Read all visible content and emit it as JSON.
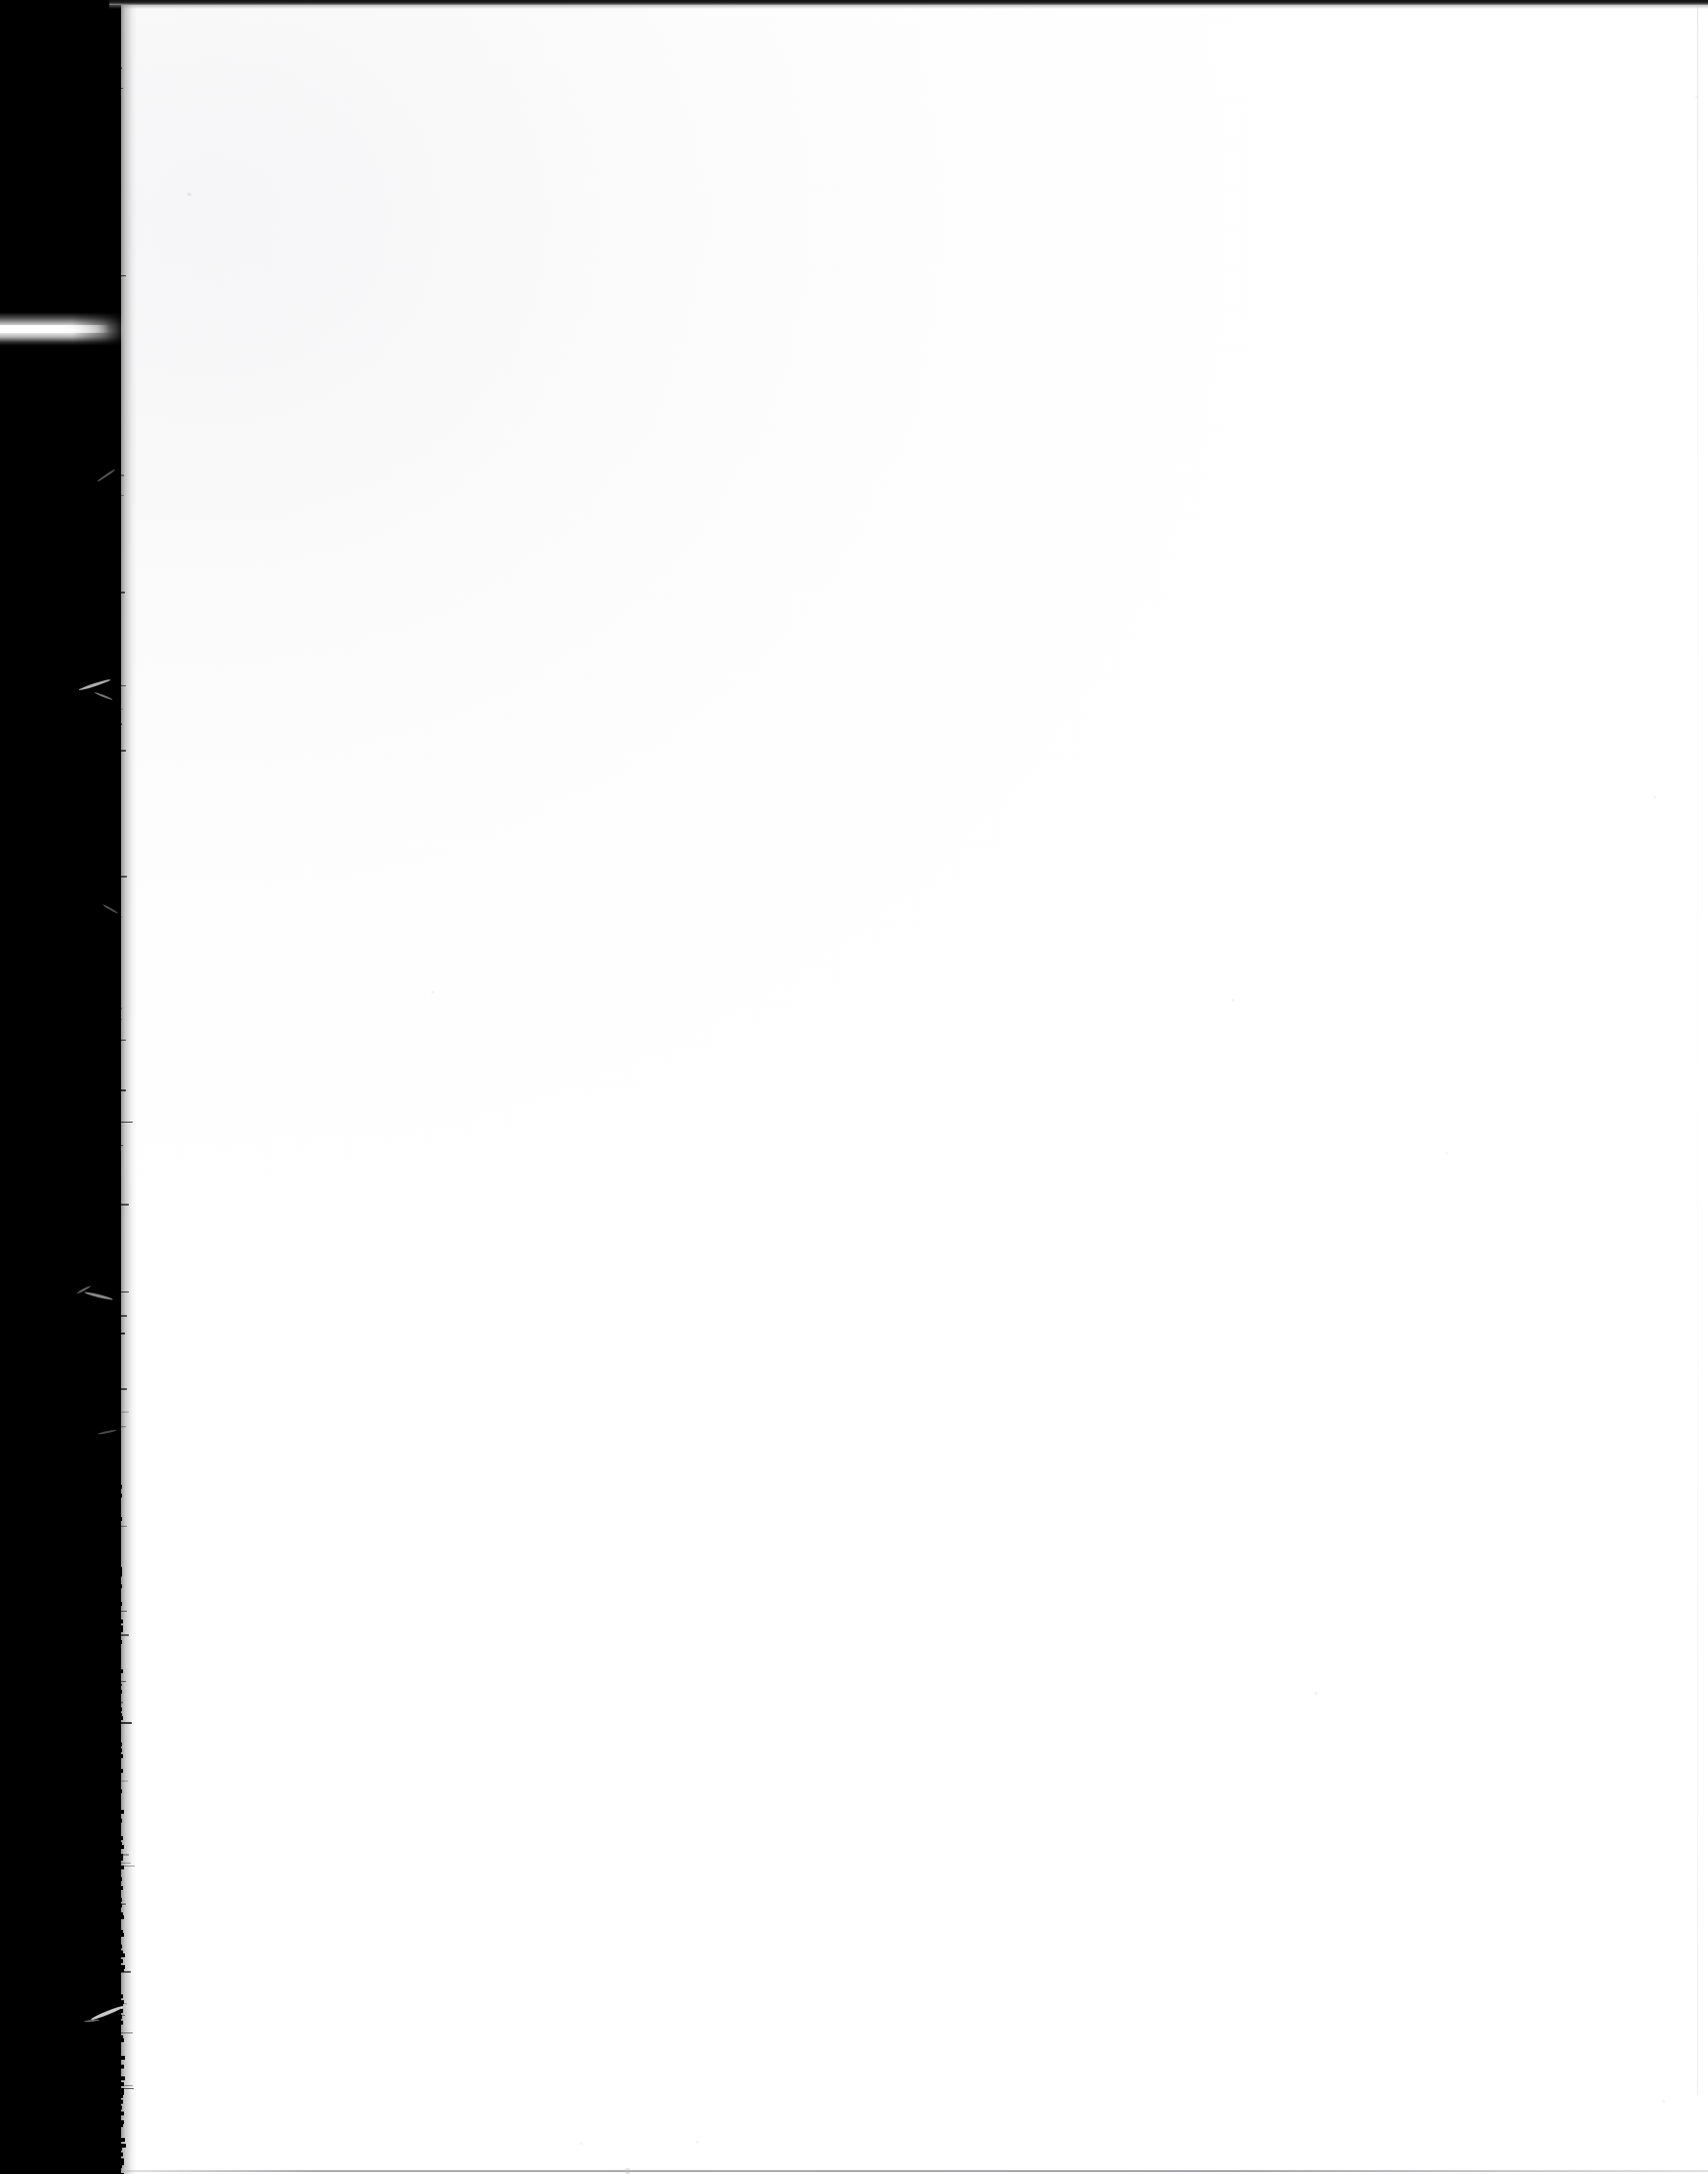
{
  "document": {
    "kind": "scanned-page",
    "page_state": "blank",
    "orientation": "portrait",
    "width_px": 1750,
    "height_px": 2227,
    "visible_text": [],
    "description": "Blank scanned book page, white paper with a black scanner gutter band down the left edge"
  },
  "colors": {
    "paper": "#ffffff",
    "paper_shadow": "#fbfbfb",
    "gutter": "#000000",
    "top_rule": "#111111",
    "bottom_rule": "#96969c",
    "right_rule": "#cdcdd2",
    "streak": "#ffffff",
    "speck": "#b9b9bf"
  },
  "regions": {
    "gutter": {
      "label": "scanner-gutter",
      "x": 0,
      "y": 0,
      "width": 124,
      "height": 2227
    },
    "paper": {
      "label": "paper-sheet",
      "x": 112,
      "y": 0,
      "width": 1638,
      "height": 2227
    },
    "top_rule": {
      "label": "top-edge-rule",
      "x": 112,
      "y": 0,
      "width": 1638,
      "height": 5
    },
    "bottom_rule": {
      "label": "bottom-edge-rule",
      "x": 124,
      "y": 2223,
      "width": 1626,
      "height": 2
    },
    "light_streak": {
      "label": "horizontal-light-streak",
      "x": 0,
      "y": 320,
      "width": 128,
      "height": 34
    }
  },
  "artifacts": {
    "fibers": [
      {
        "name": "fiber-upper",
        "x": 80,
        "y": 700,
        "width": 34,
        "height": 3,
        "rotate": -18,
        "opacity": 0.8
      },
      {
        "name": "fiber-upper-tail",
        "x": 96,
        "y": 712,
        "width": 20,
        "height": 2,
        "rotate": 22,
        "opacity": 0.55
      },
      {
        "name": "fiber-mid",
        "x": 86,
        "y": 1326,
        "width": 30,
        "height": 3,
        "rotate": 14,
        "opacity": 0.62
      },
      {
        "name": "fiber-mid-tail",
        "x": 78,
        "y": 1320,
        "width": 16,
        "height": 2,
        "rotate": -28,
        "opacity": 0.45
      },
      {
        "name": "fiber-lower",
        "x": 92,
        "y": 2060,
        "width": 36,
        "height": 4,
        "rotate": -22,
        "opacity": 0.92
      },
      {
        "name": "fiber-lower-tail",
        "x": 86,
        "y": 2069,
        "width": 16,
        "height": 2,
        "rotate": -6,
        "opacity": 0.5
      },
      {
        "name": "fiber-top-a",
        "x": 98,
        "y": 486,
        "width": 22,
        "height": 2,
        "rotate": -34,
        "opacity": 0.42
      },
      {
        "name": "fiber-top-b",
        "x": 104,
        "y": 930,
        "width": 18,
        "height": 2,
        "rotate": 30,
        "opacity": 0.38
      },
      {
        "name": "fiber-top-c",
        "x": 100,
        "y": 1466,
        "width": 20,
        "height": 2,
        "rotate": -12,
        "opacity": 0.34
      }
    ],
    "specks": [
      {
        "name": "speck-a",
        "x": 192,
        "y": 197,
        "size": 4,
        "opacity": 0.3
      },
      {
        "name": "speck-b",
        "x": 640,
        "y": 2221,
        "size": 6,
        "opacity": 0.42
      },
      {
        "name": "speck-c",
        "x": 1347,
        "y": 1733,
        "size": 3,
        "opacity": 0.22
      },
      {
        "name": "speck-d",
        "x": 1262,
        "y": 1023,
        "size": 3,
        "opacity": 0.16
      },
      {
        "name": "speck-e",
        "x": 1703,
        "y": 2151,
        "size": 3,
        "opacity": 0.18
      },
      {
        "name": "speck-f",
        "x": 1694,
        "y": 815,
        "size": 3,
        "opacity": 0.16
      },
      {
        "name": "speck-g",
        "x": 442,
        "y": 1015,
        "size": 3,
        "opacity": 0.14
      },
      {
        "name": "speck-h",
        "x": 1737,
        "y": 98,
        "size": 3,
        "opacity": 0.16
      },
      {
        "name": "speck-i",
        "x": 594,
        "y": 2194,
        "size": 3,
        "opacity": 0.18
      },
      {
        "name": "speck-j",
        "x": 713,
        "y": 2193,
        "size": 3,
        "opacity": 0.14
      },
      {
        "name": "speck-k",
        "x": 1481,
        "y": 1180,
        "size": 3,
        "opacity": 0.12
      }
    ]
  }
}
